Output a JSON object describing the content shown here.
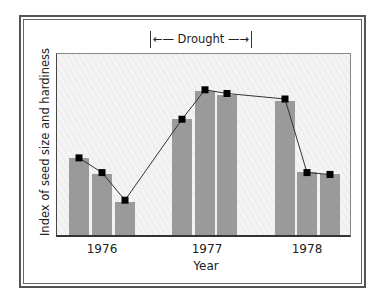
{
  "chart_data": {
    "type": "bar",
    "title": "",
    "xlabel": "Year",
    "ylabel": "Index of seed size and hardiness",
    "categories": [
      "1976",
      "1977",
      "1978"
    ],
    "bars_per_category": 3,
    "bar_values": [
      [
        42,
        33,
        18
      ],
      [
        63,
        78,
        76
      ],
      [
        73,
        34,
        33
      ]
    ],
    "line_series": {
      "name": "Index trend (markers)",
      "values": [
        43,
        35,
        20,
        64,
        80,
        78,
        75,
        35,
        34
      ]
    },
    "ylim": [
      0,
      100
    ],
    "y_ticks": [],
    "grid": false,
    "legend": null,
    "annotations": [
      {
        "text": "Drought",
        "type": "span-bracket",
        "from": "late 1976",
        "to": "early 1978"
      }
    ],
    "colors": {
      "bar": "#9a9a9a",
      "marker": "#000000",
      "line": "#333333",
      "plot_background": "#f2f2f2"
    }
  },
  "labels": {
    "drought": "←— Drought —→",
    "x_axis": "Year",
    "y_axis": "Index of seed size and hardiness",
    "ticks": [
      "1976",
      "1977",
      "1978"
    ]
  }
}
